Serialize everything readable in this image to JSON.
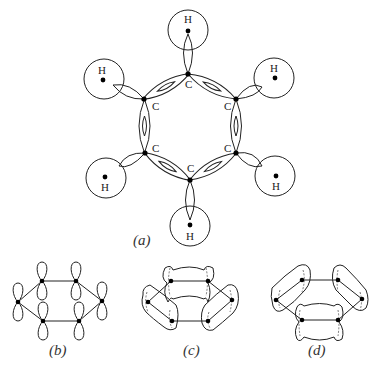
{
  "figure": {
    "panel_a": {
      "label": "(a)",
      "carbon_label": "C",
      "hydrogen_label": "H",
      "carbons": [
        {
          "id": "c1",
          "x": 188,
          "y": 74
        },
        {
          "id": "c2",
          "x": 236,
          "y": 99
        },
        {
          "id": "c3",
          "x": 236,
          "y": 153
        },
        {
          "id": "c4",
          "x": 190,
          "y": 180
        },
        {
          "id": "c5",
          "x": 145,
          "y": 153
        },
        {
          "id": "c6",
          "x": 144,
          "y": 99
        }
      ],
      "hydrogens": [
        {
          "id": "h1",
          "x": 188,
          "y": 30
        },
        {
          "id": "h2",
          "x": 274,
          "y": 78
        },
        {
          "id": "h3",
          "x": 275,
          "y": 176
        },
        {
          "id": "h4",
          "x": 190,
          "y": 226
        },
        {
          "id": "h5",
          "x": 106,
          "y": 178
        },
        {
          "id": "h6",
          "x": 104,
          "y": 79
        }
      ]
    },
    "panel_b": {
      "label": "(b)"
    },
    "panel_c": {
      "label": "(c)"
    },
    "panel_d": {
      "label": "(d)"
    }
  }
}
